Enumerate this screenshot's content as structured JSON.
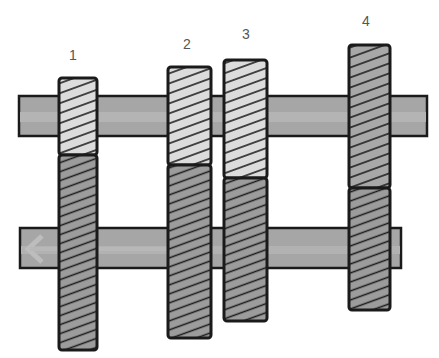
{
  "diagram": {
    "type": "gearbox-shaft-diagram",
    "labels": [
      {
        "id": "1",
        "text": "1",
        "x": 73,
        "y": 60
      },
      {
        "id": "2",
        "text": "2",
        "x": 187,
        "y": 49
      },
      {
        "id": "3",
        "text": "3",
        "x": 246,
        "y": 39
      },
      {
        "id": "4",
        "text": "4",
        "x": 366,
        "y": 26
      }
    ],
    "colors": {
      "shaft": "#a6a6a6",
      "shaft_stripe": "#b8b8b8",
      "gear_light": "#dcdcdc",
      "gear_dark": "#9c9c9c",
      "outline": "#1a1a1a",
      "hatch": "#1a1a1a"
    },
    "shafts": [
      {
        "name": "upper-shaft",
        "x": 19,
        "y": 96,
        "w": 408,
        "h": 40
      },
      {
        "name": "lower-shaft",
        "x": 20,
        "y": 228,
        "w": 381,
        "h": 40,
        "arrow": "left"
      }
    ],
    "gears": [
      {
        "id": "1",
        "x": 59,
        "w": 38,
        "upper_top": 78,
        "boundary": 155,
        "lower_bottom": 350
      },
      {
        "id": "2",
        "x": 168,
        "w": 43,
        "upper_top": 67,
        "boundary": 165,
        "lower_bottom": 338
      },
      {
        "id": "3",
        "x": 224,
        "w": 43,
        "upper_top": 60,
        "boundary": 178,
        "lower_bottom": 321
      },
      {
        "id": "4",
        "x": 349,
        "w": 41,
        "upper_top": 45,
        "boundary": 188,
        "lower_bottom": 310
      }
    ]
  }
}
